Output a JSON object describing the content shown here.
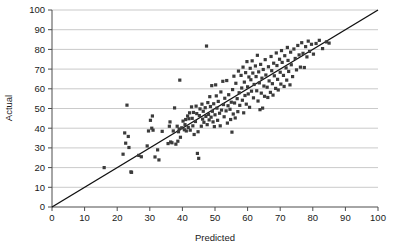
{
  "chart_data": {
    "type": "scatter",
    "title": "",
    "xlabel": "Predicted",
    "ylabel": "Actual",
    "xlim": [
      0,
      100
    ],
    "ylim": [
      0,
      100
    ],
    "xticks": [
      0,
      10,
      20,
      30,
      40,
      50,
      60,
      70,
      80,
      90,
      100
    ],
    "yticks": [
      0,
      10,
      20,
      30,
      40,
      50,
      60,
      70,
      80,
      90,
      100
    ],
    "grid": "horizontal",
    "legend": "none",
    "marker_shape": "square",
    "marker_color": "#3b3b3b",
    "reference_line": {
      "label": "identity",
      "from": [
        0,
        0
      ],
      "to": [
        100,
        100
      ],
      "color": "#111111"
    },
    "points": [
      [
        16.0,
        20.0
      ],
      [
        21.8,
        26.8
      ],
      [
        22.3,
        37.6
      ],
      [
        22.6,
        32.4
      ],
      [
        23.0,
        51.7
      ],
      [
        23.4,
        35.8
      ],
      [
        23.6,
        30.2
      ],
      [
        24.2,
        17.8
      ],
      [
        24.4,
        17.6
      ],
      [
        26.6,
        26.2
      ],
      [
        27.4,
        25.5
      ],
      [
        29.2,
        31.0
      ],
      [
        29.6,
        38.6
      ],
      [
        30.2,
        44.0
      ],
      [
        30.6,
        40.0
      ],
      [
        30.8,
        46.2
      ],
      [
        31.0,
        39.0
      ],
      [
        31.6,
        25.4
      ],
      [
        32.4,
        29.0
      ],
      [
        32.8,
        23.9
      ],
      [
        33.8,
        38.4
      ],
      [
        35.6,
        32.2
      ],
      [
        36.0,
        41.0
      ],
      [
        36.2,
        43.2
      ],
      [
        36.4,
        33.0
      ],
      [
        36.8,
        32.6
      ],
      [
        37.2,
        38.6
      ],
      [
        37.6,
        50.3
      ],
      [
        38.0,
        31.9
      ],
      [
        38.4,
        41.0
      ],
      [
        38.6,
        33.4
      ],
      [
        38.8,
        38.2
      ],
      [
        39.0,
        39.6
      ],
      [
        39.2,
        64.4
      ],
      [
        39.4,
        35.4
      ],
      [
        39.8,
        40.2
      ],
      [
        40.2,
        43.6
      ],
      [
        40.6,
        39.2
      ],
      [
        40.8,
        41.8
      ],
      [
        41.0,
        44.4
      ],
      [
        41.2,
        38.6
      ],
      [
        41.6,
        46.2
      ],
      [
        41.8,
        40.4
      ],
      [
        42.0,
        44.8
      ],
      [
        42.2,
        47.8
      ],
      [
        42.4,
        39.0
      ],
      [
        42.8,
        50.8
      ],
      [
        43.0,
        45.0
      ],
      [
        43.2,
        41.2
      ],
      [
        43.4,
        48.0
      ],
      [
        43.6,
        36.8
      ],
      [
        44.0,
        43.4
      ],
      [
        44.2,
        51.2
      ],
      [
        44.4,
        47.4
      ],
      [
        44.6,
        27.2
      ],
      [
        44.8,
        38.2
      ],
      [
        45.0,
        24.7
      ],
      [
        45.2,
        46.4
      ],
      [
        45.4,
        49.8
      ],
      [
        45.8,
        41.0
      ],
      [
        46.0,
        52.2
      ],
      [
        46.2,
        44.6
      ],
      [
        46.4,
        48.6
      ],
      [
        46.6,
        43.0
      ],
      [
        47.0,
        50.4
      ],
      [
        47.2,
        46.0
      ],
      [
        47.4,
        81.7
      ],
      [
        47.6,
        41.8
      ],
      [
        47.8,
        53.0
      ],
      [
        48.0,
        47.0
      ],
      [
        48.2,
        44.2
      ],
      [
        48.4,
        56.0
      ],
      [
        48.6,
        51.0
      ],
      [
        48.8,
        45.6
      ],
      [
        49.0,
        61.6
      ],
      [
        49.2,
        48.6
      ],
      [
        49.4,
        43.2
      ],
      [
        49.6,
        52.4
      ],
      [
        49.8,
        40.8
      ],
      [
        50.0,
        46.8
      ],
      [
        50.2,
        62.0
      ],
      [
        50.4,
        56.4
      ],
      [
        50.6,
        50.2
      ],
      [
        50.8,
        44.0
      ],
      [
        51.0,
        53.6
      ],
      [
        51.4,
        47.6
      ],
      [
        51.6,
        41.2
      ],
      [
        51.8,
        58.4
      ],
      [
        52.0,
        49.2
      ],
      [
        52.4,
        63.8
      ],
      [
        52.6,
        52.0
      ],
      [
        52.8,
        45.8
      ],
      [
        53.0,
        55.2
      ],
      [
        53.4,
        48.8
      ],
      [
        53.6,
        64.2
      ],
      [
        53.8,
        42.6
      ],
      [
        54.0,
        51.4
      ],
      [
        54.2,
        57.0
      ],
      [
        54.6,
        49.6
      ],
      [
        54.8,
        44.4
      ],
      [
        55.0,
        53.2
      ],
      [
        55.2,
        38.0
      ],
      [
        55.4,
        59.6
      ],
      [
        55.6,
        47.2
      ],
      [
        55.8,
        66.4
      ],
      [
        56.0,
        52.8
      ],
      [
        56.2,
        45.2
      ],
      [
        56.4,
        62.8
      ],
      [
        56.8,
        55.0
      ],
      [
        57.0,
        48.4
      ],
      [
        57.2,
        69.0
      ],
      [
        57.4,
        58.0
      ],
      [
        57.6,
        51.6
      ],
      [
        58.0,
        66.8
      ],
      [
        58.2,
        60.4
      ],
      [
        58.4,
        54.2
      ],
      [
        58.6,
        71.0
      ],
      [
        58.8,
        47.8
      ],
      [
        59.0,
        63.4
      ],
      [
        59.2,
        56.6
      ],
      [
        59.4,
        68.2
      ],
      [
        59.6,
        52.2
      ],
      [
        59.8,
        73.8
      ],
      [
        60.0,
        61.0
      ],
      [
        60.2,
        57.4
      ],
      [
        60.4,
        66.0
      ],
      [
        60.6,
        50.6
      ],
      [
        60.8,
        70.4
      ],
      [
        61.0,
        64.6
      ],
      [
        61.2,
        58.8
      ],
      [
        61.4,
        74.2
      ],
      [
        61.6,
        68.0
      ],
      [
        61.8,
        55.4
      ],
      [
        62.0,
        62.2
      ],
      [
        62.4,
        71.6
      ],
      [
        62.6,
        66.2
      ],
      [
        62.8,
        59.0
      ],
      [
        63.0,
        77.0
      ],
      [
        63.2,
        53.8
      ],
      [
        63.4,
        68.6
      ],
      [
        63.6,
        63.0
      ],
      [
        63.8,
        49.4
      ],
      [
        64.0,
        72.4
      ],
      [
        64.2,
        57.8
      ],
      [
        64.4,
        65.4
      ],
      [
        64.6,
        50.2
      ],
      [
        64.8,
        69.8
      ],
      [
        65.0,
        61.4
      ],
      [
        65.2,
        56.2
      ],
      [
        65.4,
        74.8
      ],
      [
        65.6,
        67.0
      ],
      [
        66.0,
        60.8
      ],
      [
        66.2,
        55.6
      ],
      [
        66.4,
        71.2
      ],
      [
        66.6,
        64.0
      ],
      [
        67.0,
        58.2
      ],
      [
        67.2,
        76.4
      ],
      [
        67.4,
        69.2
      ],
      [
        67.6,
        62.6
      ],
      [
        67.8,
        56.8
      ],
      [
        68.0,
        73.0
      ],
      [
        68.2,
        66.6
      ],
      [
        68.6,
        60.2
      ],
      [
        68.8,
        78.2
      ],
      [
        69.0,
        71.8
      ],
      [
        69.2,
        64.8
      ],
      [
        69.4,
        59.4
      ],
      [
        69.8,
        75.0
      ],
      [
        70.0,
        68.4
      ],
      [
        70.2,
        62.4
      ],
      [
        70.4,
        79.4
      ],
      [
        70.6,
        73.4
      ],
      [
        71.0,
        66.8
      ],
      [
        71.2,
        61.2
      ],
      [
        71.4,
        76.8
      ],
      [
        71.8,
        70.6
      ],
      [
        72.0,
        64.4
      ],
      [
        72.2,
        81.0
      ],
      [
        72.4,
        74.4
      ],
      [
        72.6,
        68.8
      ],
      [
        73.0,
        62.0
      ],
      [
        73.2,
        78.6
      ],
      [
        73.4,
        72.2
      ],
      [
        73.8,
        66.2
      ],
      [
        74.2,
        80.2
      ],
      [
        74.6,
        75.4
      ],
      [
        75.0,
        69.6
      ],
      [
        75.4,
        82.0
      ],
      [
        75.8,
        77.2
      ],
      [
        76.2,
        71.0
      ],
      [
        76.6,
        83.4
      ],
      [
        77.0,
        78.0
      ],
      [
        77.4,
        70.8
      ],
      [
        77.8,
        81.4
      ],
      [
        78.2,
        76.2
      ],
      [
        78.6,
        84.2
      ],
      [
        79.0,
        79.0
      ],
      [
        79.6,
        82.6
      ],
      [
        80.2,
        77.6
      ],
      [
        81.0,
        83.0
      ],
      [
        82.0,
        84.6
      ],
      [
        83.0,
        80.4
      ],
      [
        84.2,
        83.8
      ],
      [
        85.0,
        83.2
      ]
    ]
  },
  "accessibility": {
    "chart_description": "Scatter plot of Actual versus Predicted values with identity reference line"
  }
}
